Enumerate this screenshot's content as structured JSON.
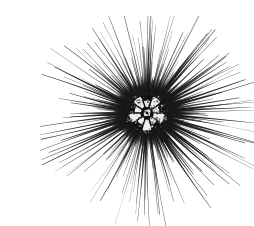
{
  "image": {
    "domain": "Natural-Image",
    "subject_name": "sea-urchin",
    "common_name": "Long-spined sea urchin",
    "view": "dorsal (aboral) view",
    "rendering_style": "high-contrast black and white photograph",
    "width": 214,
    "height": 210,
    "background_color": "#ffffff",
    "ink_color": "#1a1a1a",
    "alt_text": "A long-spined sea urchin viewed from above, its many thin black spines radiating outward from a small round central test on a plain white background."
  },
  "composition": {
    "center_x": 107,
    "center_y": 97,
    "body_radius": 22,
    "dense_ring_radius": 30,
    "spine_span_min": 38,
    "spine_span_max": 96,
    "bounds_note": "spines reach the upper-left and right edges of the frame",
    "extreme_left_x": 14,
    "extreme_right_x": 213,
    "extreme_top_y": 11,
    "extreme_bottom_y": 196
  },
  "central_test": {
    "label": "central test (body shell)",
    "pattern": "five-fold rosette of pale plates around a small light apical disc",
    "apical_disc_color": "#f2f2f2",
    "plate_highlight_color": "#ededed",
    "plate_shadow_color": "#101010",
    "petal_count": 5,
    "apical_disc_radius": 3.4
  },
  "spines": {
    "label": "radiating spines",
    "approx_count": 150,
    "longest_spine_direction": "east (reaches right frame edge)",
    "notable_spines": [
      {
        "name": "long-upper-left-spine",
        "angle_deg": 207,
        "length": 100
      },
      {
        "name": "long-horizontal-right-spine",
        "angle_deg": 357,
        "length": 108
      },
      {
        "name": "long-upper-right-spine",
        "angle_deg": 332,
        "length": 92
      },
      {
        "name": "long-top-spine",
        "angle_deg": 272,
        "length": 88
      },
      {
        "name": "long-lower-right-spine",
        "angle_deg": 36,
        "length": 90
      },
      {
        "name": "long-bottom-spine",
        "angle_deg": 95,
        "length": 97
      }
    ],
    "taper": "thick at base, tapering to a fine point",
    "base_width_px": 2.6,
    "tip_width_px": 0.35
  }
}
